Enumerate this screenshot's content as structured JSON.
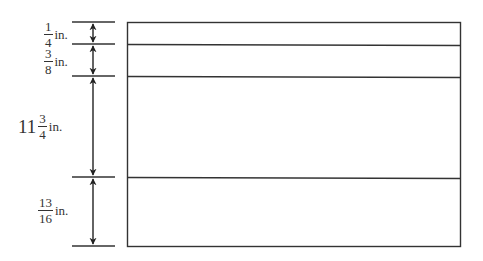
{
  "diagram": {
    "type": "layered-dimension-diagram",
    "stroke_color": "#333333",
    "layers": [
      {
        "whole": "",
        "numerator": "1",
        "denominator": "4",
        "unit": "in.",
        "value_in": 0.25
      },
      {
        "whole": "",
        "numerator": "3",
        "denominator": "8",
        "unit": "in.",
        "value_in": 0.375
      },
      {
        "whole": "11",
        "numerator": "3",
        "denominator": "4",
        "unit": "in.",
        "value_in": 11.75
      },
      {
        "whole": "",
        "numerator": "13",
        "denominator": "16",
        "unit": "in.",
        "value_in": 0.8125
      }
    ]
  }
}
